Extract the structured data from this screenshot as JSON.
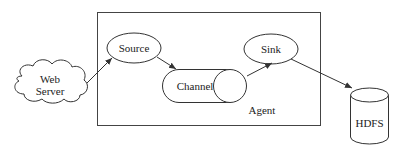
{
  "diagram": {
    "container": {
      "label": "Agent"
    },
    "nodes": [
      {
        "id": "web-server",
        "label_lines": [
          "Web",
          "Server"
        ],
        "shape": "cloud"
      },
      {
        "id": "source",
        "label": "Source",
        "shape": "ellipse"
      },
      {
        "id": "channel",
        "label": "Channel",
        "shape": "horizontal-cylinder"
      },
      {
        "id": "sink",
        "label": "Sink",
        "shape": "ellipse"
      },
      {
        "id": "hdfs",
        "label": "HDFS",
        "shape": "cylinder"
      }
    ],
    "edges": [
      {
        "from": "web-server",
        "to": "source"
      },
      {
        "from": "source",
        "to": "channel"
      },
      {
        "from": "channel",
        "to": "sink"
      },
      {
        "from": "sink",
        "to": "hdfs"
      }
    ],
    "colors": {
      "stroke": "#333333",
      "background": "#ffffff"
    }
  }
}
